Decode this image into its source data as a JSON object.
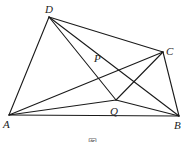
{
  "figure": {
    "points": {
      "A": {
        "x": 9,
        "y": 115,
        "label": "A",
        "lx": 3,
        "ly": 128
      },
      "B": {
        "x": 179,
        "y": 116,
        "label": "B",
        "lx": 174,
        "ly": 129
      },
      "C": {
        "x": 163,
        "y": 52,
        "label": "C",
        "lx": 166,
        "ly": 55
      },
      "D": {
        "x": 49,
        "y": 17,
        "label": "D",
        "lx": 45,
        "ly": 13
      },
      "P": {
        "x": 92,
        "y": 67,
        "label": "P",
        "lx": 94,
        "ly": 62
      },
      "Q": {
        "x": 116,
        "y": 100,
        "label": "Q",
        "lx": 110,
        "ly": 115
      }
    },
    "segments": [
      [
        "A",
        "D"
      ],
      [
        "D",
        "C"
      ],
      [
        "C",
        "B"
      ],
      [
        "A",
        "B"
      ],
      [
        "A",
        "C"
      ],
      [
        "A",
        "Q"
      ],
      [
        "Q",
        "B"
      ],
      [
        "Q",
        "C"
      ],
      [
        "D",
        "Q"
      ],
      [
        "D",
        "B"
      ]
    ],
    "caption": "图"
  }
}
